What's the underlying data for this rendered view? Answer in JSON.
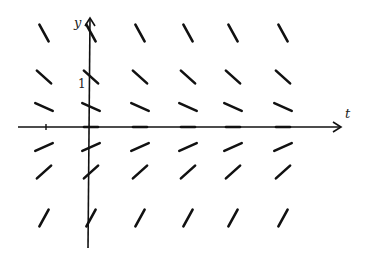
{
  "diagram": {
    "type": "slope-field",
    "equation_implied": "dy/dx = -y",
    "axes": {
      "x_label": "t",
      "y_label": "y",
      "y_tick_labels": [
        "1"
      ]
    },
    "columns_x": [
      -1,
      0,
      1,
      2,
      3,
      4
    ],
    "rows_y": [
      2,
      1,
      0.5,
      0,
      -0.5,
      -1,
      -2
    ],
    "slope_rule": "slope = -y"
  }
}
